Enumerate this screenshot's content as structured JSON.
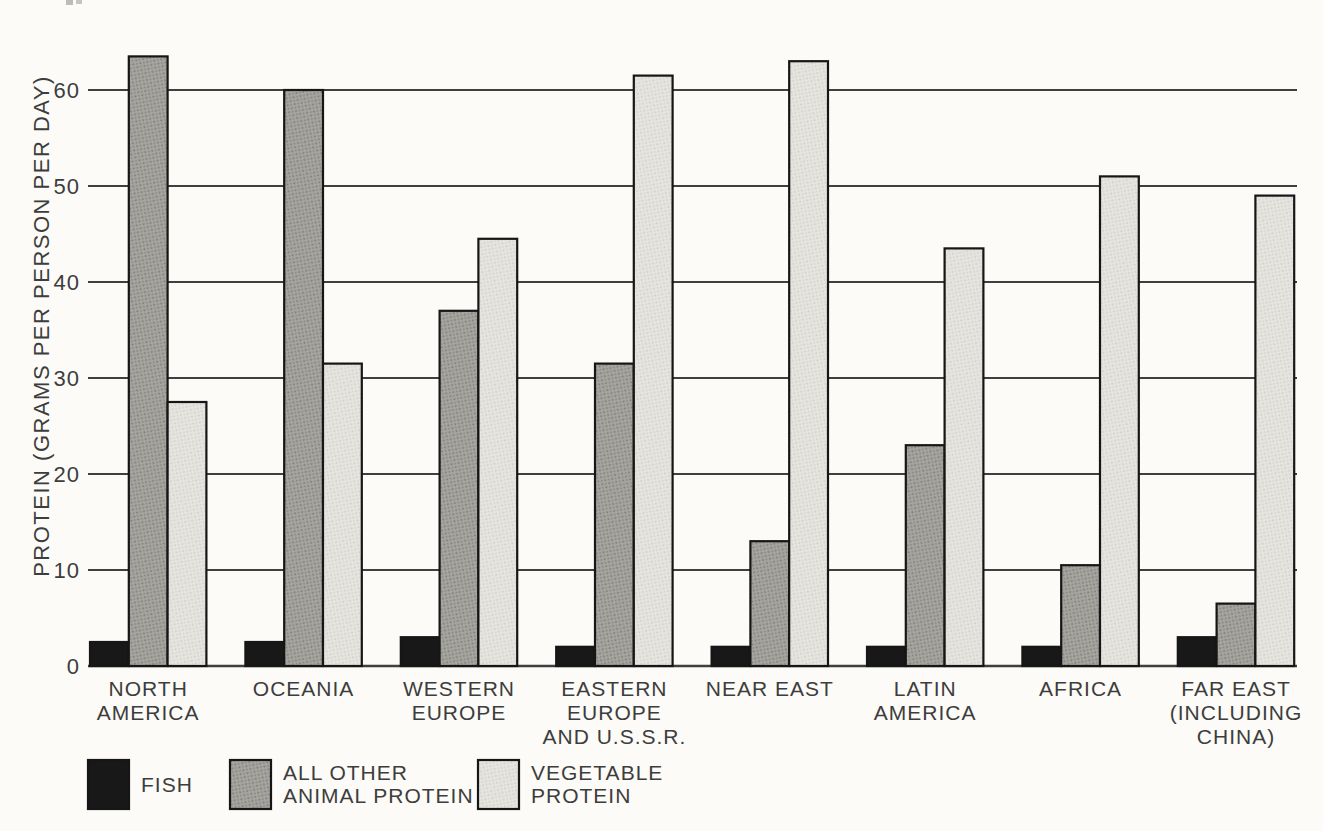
{
  "figure": {
    "background": "#fcfbf8",
    "text_color": "#3d3d3d",
    "grid_color": "#3f3f3f",
    "bar_outline_color": "#161616"
  },
  "chart_data": {
    "type": "bar",
    "title": "",
    "xlabel": "",
    "ylabel": "PROTEIN (GRAMS PER PERSON PER DAY)",
    "ylim": [
      0,
      65
    ],
    "yticks": [
      0,
      10,
      20,
      30,
      40,
      50,
      60
    ],
    "grid": true,
    "legend_position": "bottom",
    "categories": [
      "NORTH AMERICA",
      "OCEANIA",
      "WESTERN EUROPE",
      "EASTERN EUROPE AND U.S.S.R.",
      "NEAR EAST",
      "LATIN AMERICA",
      "AFRICA",
      "FAR EAST (INCLUDING CHINA)"
    ],
    "category_label_lines": [
      [
        "NORTH",
        "AMERICA"
      ],
      [
        "OCEANIA"
      ],
      [
        "WESTERN",
        "EUROPE"
      ],
      [
        "EASTERN",
        "EUROPE",
        "AND U.S.S.R."
      ],
      [
        "NEAR EAST"
      ],
      [
        "LATIN",
        "AMERICA"
      ],
      [
        "AFRICA"
      ],
      [
        "FAR EAST",
        "(INCLUDING",
        "CHINA)"
      ]
    ],
    "series": [
      {
        "name": "FISH",
        "label_lines": [
          "FISH"
        ],
        "color": "#181818",
        "dot_color": "#181818",
        "texture": "solid",
        "values": [
          2.5,
          2.5,
          3,
          2,
          2,
          2,
          2,
          3
        ]
      },
      {
        "name": "ALL OTHER ANIMAL PROTEIN",
        "label_lines": [
          "ALL OTHER",
          "ANIMAL PROTEIN"
        ],
        "color": "#a6a5a0",
        "dot_color": "#7d7c77",
        "texture": "halftone",
        "values": [
          63.5,
          60,
          37,
          31.5,
          13,
          23,
          10.5,
          6.5
        ]
      },
      {
        "name": "VEGETABLE PROTEIN",
        "label_lines": [
          "VEGETABLE",
          "PROTEIN"
        ],
        "color": "#e6e5e0",
        "dot_color": "#cfcec8",
        "texture": "halftone",
        "values": [
          27.5,
          31.5,
          44.5,
          61.5,
          63,
          43.5,
          51,
          49
        ]
      }
    ]
  }
}
